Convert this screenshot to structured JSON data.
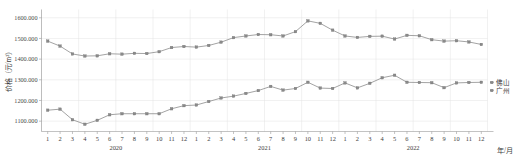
{
  "chart_data": {
    "type": "line",
    "title": "",
    "xlabel": "年/月",
    "ylabel": "价格（元/m²）",
    "ylim": [
      1050,
      1640
    ],
    "yticks": [
      "1100.000",
      "1200.000",
      "1300.000",
      "1400.000",
      "1500.000",
      "1600.000"
    ],
    "ytick_values": [
      1100,
      1200,
      1300,
      1400,
      1500,
      1600
    ],
    "grid": true,
    "legend_position": "right",
    "years": [
      "2020",
      "2021",
      "2022"
    ],
    "month_labels": [
      "1",
      "2",
      "3",
      "4",
      "5",
      "6",
      "7",
      "8",
      "9",
      "10",
      "11",
      "12"
    ],
    "x": [
      "2020-1",
      "2020-2",
      "2020-3",
      "2020-4",
      "2020-5",
      "2020-6",
      "2020-7",
      "2020-8",
      "2020-9",
      "2020-10",
      "2020-11",
      "2020-12",
      "2021-1",
      "2021-2",
      "2021-3",
      "2021-4",
      "2021-5",
      "2021-6",
      "2021-7",
      "2021-8",
      "2021-9",
      "2021-10",
      "2021-11",
      "2021-12",
      "2022-1",
      "2022-2",
      "2022-3",
      "2022-4",
      "2022-5",
      "2022-6",
      "2022-7",
      "2022-8",
      "2022-9",
      "2022-10",
      "2022-11",
      "2022-12"
    ],
    "series": [
      {
        "name": "佛山",
        "color": "#8a8a8a",
        "values": [
          1487,
          1463,
          1425,
          1415,
          1416,
          1426,
          1424,
          1428,
          1427,
          1436,
          1456,
          1461,
          1458,
          1466,
          1482,
          1504,
          1512,
          1519,
          1518,
          1512,
          1533,
          1585,
          1573,
          1540,
          1512,
          1505,
          1510,
          1511,
          1497,
          1515,
          1513,
          1494,
          1487,
          1489,
          1483,
          1471
        ]
      },
      {
        "name": "广州",
        "color": "#8a8a8a",
        "values": [
          1153,
          1158,
          1107,
          1085,
          1104,
          1131,
          1136,
          1136,
          1136,
          1136,
          1160,
          1175,
          1178,
          1195,
          1212,
          1221,
          1234,
          1248,
          1268,
          1250,
          1258,
          1288,
          1260,
          1258,
          1285,
          1261,
          1283,
          1310,
          1322,
          1288,
          1287,
          1286,
          1262,
          1285,
          1287,
          1288
        ]
      }
    ]
  },
  "legend": {
    "items": [
      {
        "label": "佛山"
      },
      {
        "label": "广州"
      }
    ]
  },
  "axis": {
    "y_title": "价格（元/m²）",
    "x_title": "年/月"
  }
}
